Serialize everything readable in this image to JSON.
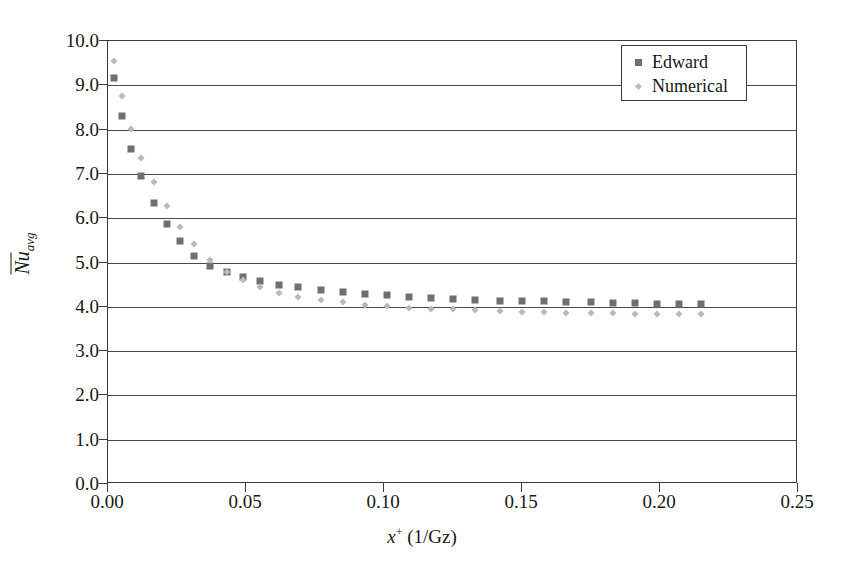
{
  "chart_data": {
    "type": "scatter",
    "title": "",
    "xlabel": "x+ (1/Gz)",
    "ylabel": "Nu_avg",
    "xlim": [
      0.0,
      0.25
    ],
    "ylim": [
      0.0,
      10.0
    ],
    "xticks": [
      "0.00",
      "0.05",
      "0.10",
      "0.15",
      "0.20",
      "0.25"
    ],
    "xtick_values": [
      0.0,
      0.05,
      0.1,
      0.15,
      0.2,
      0.25
    ],
    "yticks": [
      "0.0",
      "1.0",
      "2.0",
      "3.0",
      "4.0",
      "5.0",
      "6.0",
      "7.0",
      "8.0",
      "9.0",
      "10.0"
    ],
    "ytick_values": [
      0,
      1,
      2,
      3,
      4,
      5,
      6,
      7,
      8,
      9,
      10
    ],
    "grid": "horizontal",
    "legend_position": "top-right",
    "series": [
      {
        "name": "Edward",
        "marker": "square",
        "color": "#6e6e73",
        "points": [
          [
            0.0022,
            9.16
          ],
          [
            0.005,
            8.31
          ],
          [
            0.0082,
            7.57
          ],
          [
            0.0118,
            6.95
          ],
          [
            0.0165,
            6.35
          ],
          [
            0.0215,
            5.88
          ],
          [
            0.0262,
            5.49
          ],
          [
            0.031,
            5.15
          ],
          [
            0.037,
            4.93
          ],
          [
            0.043,
            4.78
          ],
          [
            0.049,
            4.67
          ],
          [
            0.055,
            4.58
          ],
          [
            0.062,
            4.5
          ],
          [
            0.069,
            4.44
          ],
          [
            0.077,
            4.39
          ],
          [
            0.085,
            4.34
          ],
          [
            0.093,
            4.3
          ],
          [
            0.101,
            4.26
          ],
          [
            0.109,
            4.23
          ],
          [
            0.117,
            4.2
          ],
          [
            0.125,
            4.18
          ],
          [
            0.133,
            4.16
          ],
          [
            0.142,
            4.14
          ],
          [
            0.15,
            4.13
          ],
          [
            0.158,
            4.12
          ],
          [
            0.166,
            4.11
          ],
          [
            0.175,
            4.1
          ],
          [
            0.183,
            4.09
          ],
          [
            0.191,
            4.08
          ],
          [
            0.199,
            4.07
          ],
          [
            0.207,
            4.07
          ],
          [
            0.215,
            4.06
          ]
        ]
      },
      {
        "name": "Numerical",
        "marker": "diamond",
        "color": "#b9b9bd",
        "points": [
          [
            0.0022,
            9.55
          ],
          [
            0.005,
            8.75
          ],
          [
            0.0082,
            8.01
          ],
          [
            0.0118,
            7.37
          ],
          [
            0.0165,
            6.82
          ],
          [
            0.0215,
            6.28
          ],
          [
            0.0262,
            5.81
          ],
          [
            0.031,
            5.41
          ],
          [
            0.037,
            5.06
          ],
          [
            0.043,
            4.78
          ],
          [
            0.049,
            4.6
          ],
          [
            0.055,
            4.45
          ],
          [
            0.062,
            4.32
          ],
          [
            0.069,
            4.22
          ],
          [
            0.077,
            4.15
          ],
          [
            0.085,
            4.1
          ],
          [
            0.093,
            4.05
          ],
          [
            0.101,
            4.01
          ],
          [
            0.109,
            3.98
          ],
          [
            0.117,
            3.96
          ],
          [
            0.125,
            3.94
          ],
          [
            0.133,
            3.92
          ],
          [
            0.142,
            3.9
          ],
          [
            0.15,
            3.89
          ],
          [
            0.158,
            3.88
          ],
          [
            0.166,
            3.87
          ],
          [
            0.175,
            3.86
          ],
          [
            0.183,
            3.85
          ],
          [
            0.191,
            3.84
          ],
          [
            0.199,
            3.84
          ],
          [
            0.207,
            3.83
          ],
          [
            0.215,
            3.83
          ]
        ]
      }
    ]
  },
  "axis": {
    "xlabel_prefix": "x",
    "xlabel_sup": "+",
    "xlabel_suffix": " (1/Gz)",
    "ylabel_main": "Nu",
    "ylabel_sub": "avg"
  },
  "legend": {
    "items": [
      {
        "label": "Edward",
        "marker": "square"
      },
      {
        "label": "Numerical",
        "marker": "diamond"
      }
    ]
  },
  "colors": {
    "series_edward": "#6e6e73",
    "series_numerical": "#b9b9bd",
    "axis": "#3a3a3a",
    "grid": "#4a4a4a",
    "text": "#171717",
    "background": "#ffffff"
  }
}
